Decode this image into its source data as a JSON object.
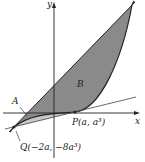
{
  "diagram": {
    "axes": {
      "x_label": "x",
      "y_label": "y"
    },
    "regions": [
      {
        "label": "A",
        "fill": "#c8c8c8"
      },
      {
        "label": "B",
        "fill": "#8a8a8a"
      }
    ],
    "points": [
      {
        "label": "P(a, a³)"
      },
      {
        "label": "Q(−2a, −8a³)"
      }
    ],
    "colors": {
      "stroke": "#222222",
      "region_a": "#c8c8c8",
      "region_b": "#8a8a8a"
    }
  }
}
